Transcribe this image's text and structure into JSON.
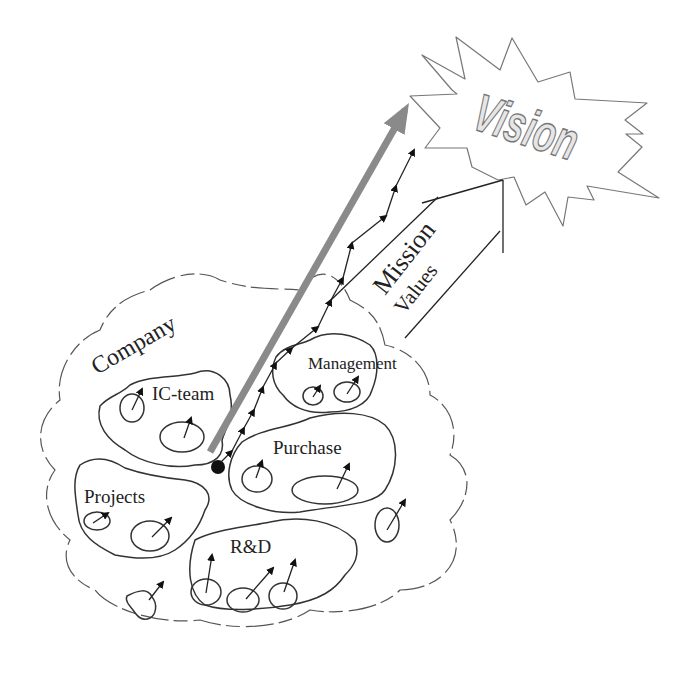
{
  "diagram": {
    "labels": {
      "vision": "Vision",
      "mission": "Mission",
      "values": "Values",
      "company": "Company",
      "ic_team": "IC-team",
      "management": "Management",
      "purchase": "Purchase",
      "projects": "Projects",
      "rnd": "R&D"
    },
    "colors": {
      "main_arrow": "#8a8a8a",
      "outline": "#333333",
      "vision_fill": "#e6e6e6",
      "background": "#ffffff"
    }
  }
}
